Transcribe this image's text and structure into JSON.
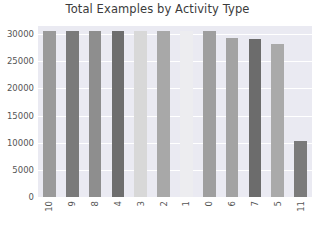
{
  "chart_data": {
    "type": "bar",
    "title": "Total Examples by Activity Type",
    "xlabel": "",
    "ylabel": "",
    "categories": [
      "10",
      "9",
      "8",
      "4",
      "3",
      "2",
      "1",
      "0",
      "6",
      "7",
      "5",
      "11"
    ],
    "values": [
      30500,
      30500,
      30500,
      30500,
      30500,
      30500,
      30500,
      30500,
      29300,
      29100,
      28200,
      10300
    ],
    "ylim": [
      0,
      31500
    ],
    "yticks": [
      0,
      5000,
      10000,
      15000,
      20000,
      25000,
      30000
    ],
    "ytick_labels": [
      "0",
      "5000",
      "10000",
      "15000",
      "20000",
      "25000",
      "30000"
    ],
    "grid": true,
    "grid_axis": "y",
    "legend": false,
    "bar_colors": [
      "#9a9a9a",
      "#7a7a7a",
      "#8e8e8e",
      "#6e6e6e",
      "#d8d8d8",
      "#a8a8a8",
      "#ededf0",
      "#9f9f9f",
      "#a3a3a3",
      "#6c6c6c",
      "#aaaaaa",
      "#7b7b7b"
    ],
    "plot_background": "#eaeaf2",
    "grid_color": "#ffffff",
    "figure_background": "#ffffff",
    "text_color": "#555555",
    "title_color": "#3b3b3b"
  }
}
